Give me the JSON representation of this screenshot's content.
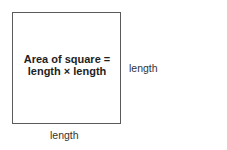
{
  "diagram": {
    "shape": "square",
    "formula": {
      "line1": "Area of square =",
      "line2": "length × length"
    },
    "side_labels": {
      "right": "length",
      "bottom": "length"
    },
    "colors": {
      "border": "#5a5a5a",
      "text": "#1e1e1e",
      "background": "#ffffff"
    }
  }
}
